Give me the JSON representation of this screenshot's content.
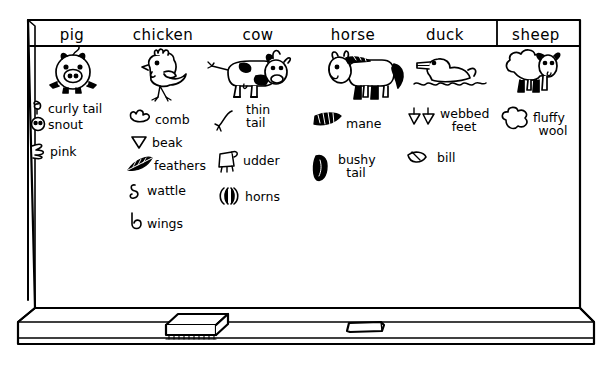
{
  "board": {
    "type": "chalkboard",
    "title_row_present": true,
    "ledge_items": [
      {
        "name": "eraser",
        "label": "eraser"
      },
      {
        "name": "chalk",
        "label": "chalk"
      }
    ]
  },
  "columns": [
    {
      "header": "pig",
      "drawing": "pig-drawing",
      "items": [
        {
          "icon": "curly-tail-icon",
          "label": "curly tail"
        },
        {
          "icon": "snout-icon",
          "label": "snout"
        },
        {
          "icon": "pink-scribble-icon",
          "label": "pink"
        }
      ]
    },
    {
      "header": "chicken",
      "drawing": "chicken-drawing",
      "items": [
        {
          "icon": "comb-icon",
          "label": "comb"
        },
        {
          "icon": "beak-icon",
          "label": "beak"
        },
        {
          "icon": "feathers-icon",
          "label": "feathers"
        },
        {
          "icon": "wattle-icon",
          "label": "wattle"
        },
        {
          "icon": "wings-icon",
          "label": "wings"
        }
      ]
    },
    {
      "header": "cow",
      "drawing": "cow-drawing",
      "items": [
        {
          "icon": "thin-tail-icon",
          "label": "thin",
          "label2": "tail"
        },
        {
          "icon": "udder-icon",
          "label": "udder"
        },
        {
          "icon": "horns-icon",
          "label": "horns"
        }
      ]
    },
    {
      "header": "horse",
      "drawing": "horse-drawing",
      "items": [
        {
          "icon": "mane-icon",
          "label": "mane"
        },
        {
          "icon": "bushy-tail-icon",
          "label": "bushy",
          "label2": "tail"
        }
      ]
    },
    {
      "header": "duck",
      "drawing": "duck-drawing",
      "items": [
        {
          "icon": "webbed-feet-icon",
          "label": "webbed",
          "label2": "feet"
        },
        {
          "icon": "bill-icon",
          "label": "bill"
        }
      ]
    },
    {
      "header": "sheep",
      "drawing": "sheep-drawing",
      "items": [
        {
          "icon": "fluffy-wool-icon",
          "label": "fluffy",
          "label2": "wool"
        }
      ]
    }
  ],
  "colors": {
    "ink": "#000000",
    "board": "#ffffff"
  }
}
